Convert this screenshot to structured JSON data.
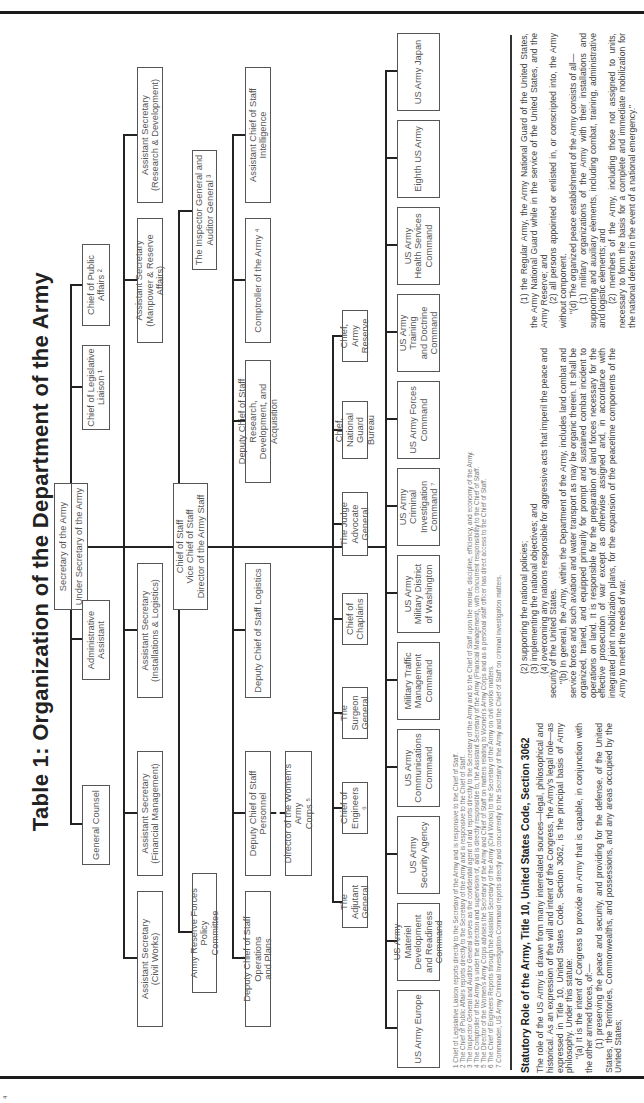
{
  "title": "Table 1: Organization of the Department of the Army",
  "page_number": "4",
  "chart": {
    "top": {
      "line1": "Secretary of the Army",
      "line2": "Under Secretary of the Army"
    },
    "chief_of_staff": "Chief of Staff\nVice Chief of Staff\nDirector of the Army Staff",
    "row_a": [
      {
        "label": "General Counsel"
      },
      {
        "label": "Administrative\nAssistant"
      },
      {
        "label": "Chief of Legislative\nLiaison ¹"
      },
      {
        "label": "Chief of Public\nAffairs ²"
      }
    ],
    "row_b": [
      {
        "label": "Assistant Secretary\n(Civil Works)"
      },
      {
        "label": "Assistant Secretary\n(Financial Management)"
      },
      {
        "label": "Assistant Secretary\n(Installations & Logistics)"
      },
      {
        "label": "Assistant Secretary\n(Manpower & Reserve Affairs)"
      },
      {
        "label": "Assistant Secretary\n(Research & Development)"
      }
    ],
    "arfpc": "Army Reserve Forces Policy\nCommittee",
    "inspector_general": "The Inspector General and\nAuditor General ³",
    "row_c": [
      {
        "label": "Deputy Chief of Staff Operations\nand Plans"
      },
      {
        "label": "Deputy Chief of Staff Personnel"
      },
      {
        "label": "Deputy Chief of Staff Logistics"
      },
      {
        "label": "Deputy Chief of Staff Research,\nDevelopment, and Acquisition"
      },
      {
        "label": "Comptroller of the Army ⁴"
      },
      {
        "label": "Assistant Chief of Staff\nIntelligence"
      }
    ],
    "wac": "Director of the Women's Army\nCorps ⁵",
    "row_d": [
      {
        "label": "The Adjutant\nGeneral"
      },
      {
        "label": "Chief of\nEngineers ⁶"
      },
      {
        "label": "The Surgeon\nGeneral"
      },
      {
        "label": "Chief of\nChaplains"
      },
      {
        "label": "The Judge\nAdvocate General"
      },
      {
        "label": "Chief, National\nGuard Bureau"
      },
      {
        "label": "Chief, Army\nReserve"
      }
    ],
    "row_e": [
      {
        "label": "US Army Europe"
      },
      {
        "label": "US Army Materiel\nDevelopment\nand Readiness\nCommand"
      },
      {
        "label": "US Army\nSecurity Agency"
      },
      {
        "label": "US Army\nCommunications\nCommand"
      },
      {
        "label": "Military Traffic\nManagement\nCommand"
      },
      {
        "label": "US Army\nMilitary District\nof Washington"
      },
      {
        "label": "US Army Criminal\nInvestigation\nCommand ⁷"
      },
      {
        "label": "US Army Forces\nCommand"
      },
      {
        "label": "US Army Training\nand Doctrine\nCommand"
      },
      {
        "label": "US Army\nHealth Services\nCommand"
      },
      {
        "label": "Eighth US Army"
      },
      {
        "label": "US Army Japan"
      }
    ]
  },
  "footnotes": [
    "1  Chief of Legislative Liaison reports directly to the Secretary of the Army and is responsive to the Chief of Staff.",
    "2  The Chief of Public Affairs reports directly to the Secretary of the Army and is responsive to the Chief of Staff.",
    "3  The Inspector General and Auditor General serves as the confidential agent of and reports directly to the Secretary of the Army and to the Chief of Staff upon the morale, discipline, efficiency, and economy of the Army.",
    "4  The Comptroller of the Army is under the direction and supervision of, and is directly responsible to, the Assistant Secretary of the Army (Financial Management), with concurrent responsibility to the Chief of Staff.",
    "5  The Director of the Women's Army Corps advises the Secretary of the Army and Chief of Staff on matters relating to Women's Army Corps and as a personal staff officer has direct access to the Chief of Staff.",
    "6  The Chief of Engineers Reports through the Assistant Secretary of the Army (Civil Works) to the Secretary of the Army on civil works matters.",
    "7  Commander, US Army Criminal Investigation Command reports directly and concurrently to the Secretary of the Army and the Chief of Staff on criminal investigation matters."
  ],
  "statute": {
    "heading": "Statutory Role of the Army, Title 10, United States Code, Section 3062",
    "col1": [
      "The role of the US Army is drawn from many interrelated sources—legal, philosophical and historical. As an expression of the will and intent of the Congress, the Army's legal role—as expressed in Title 10, United States Code, Section 3062, is the principal basis of Army philosophy. Under this statute:",
      "\"(a) It is the intent of Congress to provide an Army that is capable, in conjunction with the other armed forces, of:—",
      "(1) preserving the peace and security, and providing for the defense, of the United States, the Territories, Commonwealths, and possessions, and any areas occupied by the United States;"
    ],
    "col2": [
      "(2) supporting the national policies;",
      "(3) implementing the national objectives; and",
      "(4) overcoming any nations responsible for aggressive acts that imperil the peace and security of the United States.",
      "\"(b) In general, the Army, within the Department of the Army, includes land combat and service forces and such aviation and water transport as may be organic therein. It shall be organized, trained, and equipped primarily for prompt and sustained combat incident to operations on land. It is responsible for the preparation of land forces necessary for the effective prosecution of war except as otherwise assigned and, in accordance with integrated joint mobilization plans, for the expansion of the peacetime components of the Army to meet the needs of war."
    ],
    "col3": [
      "(1) the Regular Army, the Army National Guard of the United States, the Army National Guard while in the service of the United States, and the Army Reserve; and",
      "(2) all persons appointed or enlisted in, or conscripted into, the Army without component.",
      "\"(d) The organized peace establishment of the Army consists of all—",
      "(1) military organizations of the Army with their installations and supporting and auxiliary elements, including combat, training, administrative and logistic elements; and",
      "(2) members of the Army, including those not assigned to units, necessary to form the basis for a complete and immediate mobilization for the national defense in the event of a national emergency.\""
    ]
  }
}
